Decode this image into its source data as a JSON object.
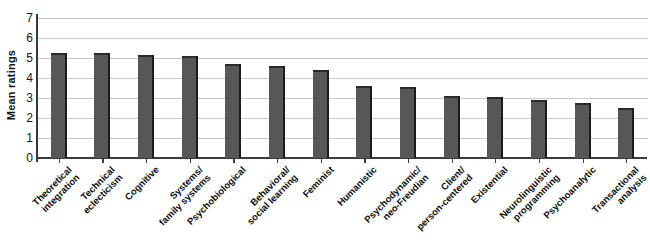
{
  "chart": {
    "type": "bar",
    "ylabel": "Mean ratings",
    "xlabel": ""
  },
  "chart_data": {
    "type": "bar",
    "title": "",
    "subtitle": "",
    "xlabel": "",
    "ylabel": "Mean ratings",
    "ylim": [
      0,
      7
    ],
    "yticks": [
      0,
      1,
      2,
      3,
      4,
      5,
      6,
      7
    ],
    "ytick_labels": [
      "0",
      "1",
      "2",
      "3",
      "4",
      "5",
      "6",
      "7"
    ],
    "grid": true,
    "legend": false,
    "legend_position": "none",
    "bar_color": "#575757",
    "bar_edge_color": "#1c1c1c",
    "gridline_color": "#c9c9c9",
    "axis_color": "#3a3a3a",
    "categories": [
      "Theoretical integration",
      "Technical eclecticism",
      "Cognitive",
      "Systems/ family systems",
      "Psychobiological",
      "Behavioral/ social learning",
      "Feminist",
      "Humanistic",
      "Psychodynamic/ neo-Freudian",
      "Client/ person-centered",
      "Existential",
      "Neurolinguistic programming",
      "Psychoanalytic",
      "Transactional analysis"
    ],
    "category_lines": [
      [
        "Theoretical",
        "integration"
      ],
      [
        "Technical",
        "eclecticism"
      ],
      [
        "Cognitive",
        ""
      ],
      [
        "Systems/",
        "family systems"
      ],
      [
        "Psychobiological",
        ""
      ],
      [
        "Behavioral/",
        "social learning"
      ],
      [
        "Feminist",
        ""
      ],
      [
        "Humanistic",
        ""
      ],
      [
        "Psychodynamic/",
        "neo-Freudian"
      ],
      [
        "Client/",
        "person-centered"
      ],
      [
        "Existential",
        ""
      ],
      [
        "Neurolinguistic",
        "programming"
      ],
      [
        "Psychoanalytic",
        ""
      ],
      [
        "Transactional",
        "analysis"
      ]
    ],
    "values": [
      5.25,
      5.25,
      5.15,
      5.1,
      4.7,
      4.6,
      4.4,
      3.6,
      3.55,
      3.1,
      3.05,
      2.9,
      2.75,
      2.5
    ]
  }
}
